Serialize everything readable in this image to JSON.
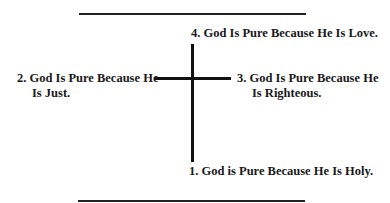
{
  "diagram": {
    "type": "cross",
    "labels": {
      "top": {
        "line1": "4. God Is Pure Because He Is Love."
      },
      "left": {
        "line1": "2. God Is Pure Because He",
        "line2": "Is Just."
      },
      "right": {
        "line1": "3. God Is Pure Because He",
        "line2": "Is Righteous."
      },
      "bottom": {
        "line1": "1. God is Pure Because He Is Holy."
      }
    },
    "colors": {
      "line": "#111111",
      "text": "#1a1a1a",
      "background": "#ffffff"
    }
  }
}
